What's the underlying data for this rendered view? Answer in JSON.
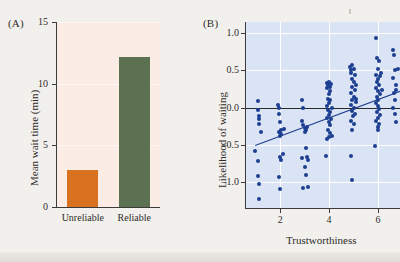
{
  "figure": {
    "background_color": "#f2f0ec",
    "width": 400,
    "height": 262
  },
  "panels": {
    "a": {
      "label": "(A)",
      "plot_background": "#fbece6"
    },
    "b": {
      "label": "(B)",
      "plot_background": "#dbe4f4"
    }
  },
  "chart_data": [
    {
      "type": "bar",
      "panel": "(A)",
      "title": "",
      "categories": [
        "Unreliable",
        "Reliable"
      ],
      "values": [
        3.0,
        12.2
      ],
      "colors": [
        "#d9721e",
        "#5b7152"
      ],
      "xlabel": "",
      "ylabel": "Mean wait time (min)",
      "ylim": [
        0,
        15
      ],
      "yticks": [
        0,
        5,
        10,
        15
      ],
      "ytick_labels": [
        "0",
        "5",
        "10",
        "15"
      ],
      "grid": "horizontal-faint",
      "legend": "none"
    },
    {
      "type": "scatter",
      "panel": "(B)",
      "title": "",
      "xlabel": "Trustworthiness",
      "ylabel": "Likelihood of waiting",
      "xlim": [
        0.6,
        6.9
      ],
      "ylim": [
        -1.35,
        1.15
      ],
      "xticks": [
        2,
        4,
        6
      ],
      "xtick_labels": [
        "2",
        "4",
        "6"
      ],
      "yticks": [
        -1.0,
        -0.5,
        0.0,
        0.5,
        1.0
      ],
      "ytick_labels": [
        "-1.0",
        "-0.5",
        "0.0",
        "0.5",
        "1.0"
      ],
      "grid": "on",
      "legend": "none",
      "point_color": "#1c3f92",
      "trendline": {
        "color": "#1f3d8f",
        "x_start": 0.95,
        "y_start": -0.5,
        "x_end": 6.9,
        "y_end": 0.23
      },
      "reference_line_y": 0.0,
      "points": [
        [
          0.95,
          -0.58
        ],
        [
          1.1,
          0.09
        ],
        [
          1.1,
          -0.03
        ],
        [
          1.12,
          -0.12
        ],
        [
          1.15,
          -0.16
        ],
        [
          1.12,
          -0.22
        ],
        [
          1.1,
          -0.72
        ],
        [
          1.1,
          -0.92
        ],
        [
          1.12,
          -1.03
        ],
        [
          1.15,
          -1.23
        ],
        [
          1.2,
          -0.33
        ],
        [
          1.9,
          0.04
        ],
        [
          1.95,
          -0.01
        ],
        [
          1.95,
          -0.08
        ],
        [
          2.0,
          -0.2
        ],
        [
          2.02,
          -0.3
        ],
        [
          1.95,
          -0.33
        ],
        [
          2.05,
          -0.36
        ],
        [
          1.98,
          -0.38
        ],
        [
          2.0,
          -0.66
        ],
        [
          2.05,
          -0.7
        ],
        [
          1.95,
          -0.93
        ],
        [
          2.0,
          -1.1
        ],
        [
          2.1,
          -0.62
        ],
        [
          2.15,
          -0.29
        ],
        [
          2.9,
          0.1
        ],
        [
          2.95,
          0.0
        ],
        [
          2.9,
          -0.18
        ],
        [
          2.95,
          -0.24
        ],
        [
          3.0,
          -0.27
        ],
        [
          3.05,
          -0.3
        ],
        [
          3.1,
          -0.26
        ],
        [
          3.0,
          -0.33
        ],
        [
          2.9,
          -0.68
        ],
        [
          3.05,
          -0.55
        ],
        [
          3.1,
          -0.67
        ],
        [
          3.0,
          -0.8
        ],
        [
          3.05,
          -0.9
        ],
        [
          2.95,
          -1.08
        ],
        [
          3.12,
          -1.07
        ],
        [
          3.15,
          -0.7
        ],
        [
          3.9,
          0.33
        ],
        [
          3.95,
          0.3
        ],
        [
          4.0,
          0.35
        ],
        [
          4.05,
          0.28
        ],
        [
          4.08,
          0.32
        ],
        [
          3.92,
          0.26
        ],
        [
          4.02,
          0.22
        ],
        [
          3.98,
          0.18
        ],
        [
          3.95,
          0.12
        ],
        [
          4.05,
          0.1
        ],
        [
          4.0,
          0.06
        ],
        [
          3.9,
          0.02
        ],
        [
          4.1,
          0.0
        ],
        [
          3.95,
          -0.03
        ],
        [
          4.05,
          -0.06
        ],
        [
          4.0,
          -0.1
        ],
        [
          3.92,
          -0.14
        ],
        [
          4.08,
          -0.16
        ],
        [
          3.98,
          -0.2
        ],
        [
          4.02,
          -0.24
        ],
        [
          3.95,
          -0.3
        ],
        [
          4.05,
          -0.34
        ],
        [
          4.0,
          -0.4
        ],
        [
          3.9,
          -0.42
        ],
        [
          4.1,
          -0.38
        ],
        [
          3.88,
          -0.65
        ],
        [
          4.85,
          0.55
        ],
        [
          4.9,
          0.5
        ],
        [
          4.95,
          0.57
        ],
        [
          5.0,
          0.52
        ],
        [
          4.88,
          0.46
        ],
        [
          5.05,
          0.44
        ],
        [
          4.92,
          0.38
        ],
        [
          5.0,
          0.34
        ],
        [
          4.95,
          0.28
        ],
        [
          5.05,
          0.24
        ],
        [
          4.9,
          0.2
        ],
        [
          5.0,
          0.14
        ],
        [
          4.95,
          0.1
        ],
        [
          5.08,
          0.08
        ],
        [
          4.88,
          0.04
        ],
        [
          5.0,
          0.0
        ],
        [
          4.92,
          -0.04
        ],
        [
          5.05,
          -0.08
        ],
        [
          4.98,
          -0.12
        ],
        [
          4.9,
          -0.18
        ],
        [
          5.02,
          -0.22
        ],
        [
          4.95,
          -0.3
        ],
        [
          5.1,
          0.3
        ],
        [
          5.12,
          0.12
        ],
        [
          4.9,
          -0.65
        ],
        [
          4.95,
          -0.97
        ],
        [
          5.9,
          0.93
        ],
        [
          5.95,
          0.66
        ],
        [
          6.05,
          0.62
        ],
        [
          6.0,
          0.52
        ],
        [
          5.92,
          0.44
        ],
        [
          6.1,
          0.42
        ],
        [
          6.0,
          0.38
        ],
        [
          5.95,
          0.34
        ],
        [
          6.05,
          0.3
        ],
        [
          5.9,
          0.26
        ],
        [
          6.0,
          0.22
        ],
        [
          6.08,
          0.18
        ],
        [
          5.95,
          0.14
        ],
        [
          6.02,
          0.1
        ],
        [
          5.9,
          0.06
        ],
        [
          6.0,
          0.02
        ],
        [
          6.05,
          -0.02
        ],
        [
          5.95,
          -0.06
        ],
        [
          6.1,
          -0.1
        ],
        [
          6.0,
          -0.14
        ],
        [
          5.92,
          -0.18
        ],
        [
          6.05,
          -0.22
        ],
        [
          5.98,
          -0.26
        ],
        [
          6.0,
          -0.3
        ],
        [
          6.12,
          0.46
        ],
        [
          6.15,
          0.24
        ],
        [
          5.88,
          -0.52
        ],
        [
          6.6,
          0.78
        ],
        [
          6.65,
          0.7
        ],
        [
          6.7,
          0.5
        ],
        [
          6.62,
          0.4
        ],
        [
          6.72,
          0.3
        ],
        [
          6.66,
          0.2
        ],
        [
          6.7,
          0.1
        ],
        [
          6.6,
          0.0
        ],
        [
          6.68,
          -0.08
        ],
        [
          6.75,
          0.24
        ],
        [
          6.8,
          0.52
        ],
        [
          6.72,
          -0.2
        ]
      ]
    }
  ]
}
